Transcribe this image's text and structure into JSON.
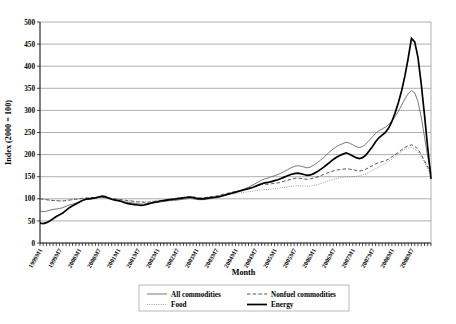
{
  "chart_data": {
    "type": "line",
    "title": "",
    "xlabel": "Month",
    "ylabel": "Index (2000 = 100)",
    "ylim": [
      0,
      500
    ],
    "ytick_values": [
      0,
      50,
      100,
      150,
      200,
      250,
      300,
      350,
      400,
      450,
      500
    ],
    "grid": true,
    "legend_position": "bottom",
    "x_start": "1999M1",
    "x_end": "2008M9",
    "xtick_labels": [
      "1999M1",
      "1999M7",
      "2000M1",
      "2000M7",
      "2001M1",
      "2001M7",
      "2002M1",
      "2002M7",
      "2003M1",
      "2003M7",
      "2004M1",
      "2004M7",
      "2005M1",
      "2005M7",
      "2006M1",
      "2006M7",
      "2007M1",
      "2007M7",
      "2008M1",
      "2008M7"
    ],
    "series": [
      {
        "name": "All commodities",
        "style": "solid-thin",
        "values": [
          72,
          71,
          72,
          74,
          76,
          77,
          78,
          80,
          83,
          86,
          88,
          90,
          93,
          96,
          98,
          99,
          100,
          101,
          103,
          104,
          103,
          101,
          99,
          98,
          97,
          95,
          93,
          92,
          91,
          90,
          89,
          88,
          88,
          89,
          90,
          91,
          92,
          93,
          94,
          95,
          96,
          96,
          97,
          98,
          99,
          100,
          101,
          100,
          99,
          98,
          98,
          99,
          100,
          101,
          102,
          104,
          106,
          108,
          110,
          112,
          114,
          117,
          120,
          123,
          126,
          130,
          134,
          138,
          142,
          145,
          147,
          150,
          152,
          155,
          158,
          162,
          166,
          170,
          173,
          175,
          174,
          172,
          170,
          172,
          176,
          181,
          187,
          193,
          200,
          207,
          213,
          218,
          222,
          225,
          228,
          226,
          222,
          218,
          216,
          218,
          224,
          232,
          240,
          248,
          254,
          258,
          262,
          268,
          276,
          286,
          298,
          312,
          326,
          338,
          345,
          340,
          320,
          285,
          240,
          195,
          160
        ]
      },
      {
        "name": "Nonfuel commodities",
        "style": "dashed",
        "values": [
          100,
          99,
          98,
          97,
          96,
          96,
          95,
          95,
          96,
          97,
          98,
          99,
          100,
          101,
          102,
          102,
          103,
          103,
          104,
          104,
          103,
          102,
          101,
          100,
          99,
          98,
          97,
          96,
          95,
          94,
          93,
          93,
          92,
          92,
          93,
          94,
          95,
          96,
          97,
          98,
          99,
          100,
          101,
          102,
          103,
          104,
          105,
          104,
          103,
          102,
          102,
          103,
          104,
          105,
          106,
          108,
          110,
          112,
          113,
          115,
          116,
          118,
          120,
          122,
          124,
          126,
          128,
          130,
          132,
          133,
          133,
          134,
          135,
          136,
          138,
          140,
          142,
          144,
          146,
          147,
          146,
          145,
          144,
          145,
          147,
          149,
          152,
          155,
          158,
          161,
          163,
          165,
          166,
          167,
          168,
          167,
          166,
          164,
          163,
          164,
          167,
          171,
          175,
          179,
          182,
          184,
          186,
          190,
          195,
          200,
          205,
          211,
          216,
          220,
          222,
          219,
          212,
          200,
          186,
          172,
          158
        ]
      },
      {
        "name": "Food",
        "style": "dotted",
        "values": [
          100,
          99,
          98,
          97,
          97,
          96,
          96,
          96,
          97,
          98,
          99,
          100,
          100,
          101,
          101,
          102,
          102,
          103,
          103,
          103,
          102,
          101,
          100,
          99,
          98,
          97,
          96,
          95,
          95,
          94,
          93,
          93,
          93,
          93,
          94,
          95,
          96,
          97,
          98,
          99,
          100,
          101,
          102,
          103,
          104,
          105,
          105,
          104,
          103,
          102,
          102,
          103,
          104,
          105,
          106,
          107,
          108,
          109,
          110,
          111,
          112,
          113,
          114,
          115,
          116,
          117,
          118,
          119,
          120,
          121,
          121,
          122,
          123,
          124,
          125,
          126,
          127,
          128,
          129,
          130,
          129,
          129,
          128,
          129,
          130,
          132,
          134,
          136,
          139,
          142,
          144,
          146,
          148,
          149,
          150,
          150,
          150,
          151,
          152,
          154,
          157,
          160,
          164,
          168,
          172,
          176,
          180,
          185,
          190,
          196,
          202,
          208,
          212,
          215,
          216,
          213,
          206,
          195,
          182,
          168,
          155
        ]
      },
      {
        "name": "Energy",
        "style": "solid-thick",
        "values": [
          45,
          44,
          46,
          50,
          55,
          60,
          64,
          68,
          74,
          80,
          84,
          88,
          92,
          96,
          99,
          100,
          101,
          102,
          104,
          106,
          105,
          102,
          99,
          97,
          96,
          94,
          91,
          89,
          88,
          87,
          86,
          85,
          86,
          88,
          90,
          92,
          93,
          95,
          96,
          97,
          98,
          99,
          100,
          101,
          102,
          103,
          104,
          103,
          101,
          100,
          100,
          101,
          102,
          103,
          104,
          105,
          107,
          109,
          111,
          113,
          115,
          117,
          119,
          121,
          123,
          125,
          128,
          131,
          134,
          136,
          137,
          139,
          141,
          143,
          146,
          149,
          152,
          155,
          157,
          158,
          157,
          155,
          153,
          154,
          157,
          161,
          166,
          171,
          177,
          183,
          189,
          194,
          198,
          201,
          204,
          201,
          197,
          193,
          191,
          193,
          199,
          208,
          218,
          229,
          238,
          244,
          250,
          260,
          275,
          295,
          318,
          345,
          378,
          418,
          463,
          455,
          420,
          360,
          290,
          215,
          145
        ]
      }
    ]
  },
  "legend": {
    "items": [
      {
        "label": "All commodities",
        "style": "solid-thin"
      },
      {
        "label": "Nonfuel commodities",
        "style": "dashed"
      },
      {
        "label": "Food",
        "style": "dotted"
      },
      {
        "label": "Energy",
        "style": "solid-thick"
      }
    ]
  }
}
